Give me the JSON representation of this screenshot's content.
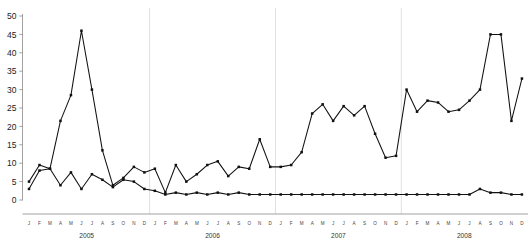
{
  "chart_data": {
    "type": "line",
    "title": "",
    "subtitle": "",
    "xlabel": "",
    "ylabel": "",
    "ylim": [
      0,
      50
    ],
    "yticks": [
      0,
      5,
      10,
      15,
      20,
      25,
      30,
      35,
      40,
      45,
      50
    ],
    "grid": false,
    "legend_position": "none",
    "year_separators": true,
    "marker": "square",
    "line_color": "#111111",
    "marker_color": "#111111",
    "axis_color": "#8a8a8a",
    "separator_color": "#dcdcdc",
    "month_labels": [
      "J",
      "F",
      "M",
      "A",
      "M",
      "J",
      "J",
      "A",
      "S",
      "O",
      "N",
      "D"
    ],
    "years": [
      "2005",
      "2006",
      "2007",
      "2008"
    ],
    "x": [
      "2005-J",
      "2005-F",
      "2005-M",
      "2005-A",
      "2005-M",
      "2005-J",
      "2005-J",
      "2005-A",
      "2005-S",
      "2005-O",
      "2005-N",
      "2005-D",
      "2006-J",
      "2006-F",
      "2006-M",
      "2006-A",
      "2006-M",
      "2006-J",
      "2006-J",
      "2006-A",
      "2006-S",
      "2006-O",
      "2006-N",
      "2006-D",
      "2007-J",
      "2007-F",
      "2007-M",
      "2007-A",
      "2007-M",
      "2007-J",
      "2007-J",
      "2007-A",
      "2007-S",
      "2007-O",
      "2007-N",
      "2007-D",
      "2008-J",
      "2008-F",
      "2008-M",
      "2008-A",
      "2008-M",
      "2008-J",
      "2008-J",
      "2008-A",
      "2008-S",
      "2008-O",
      "2008-N",
      "2008-D"
    ],
    "series": [
      {
        "name": "series-upper",
        "values": [
          5,
          9.5,
          8.5,
          21.5,
          28.5,
          46,
          30,
          13.5,
          4,
          6,
          9,
          7.5,
          8.5,
          2,
          9.5,
          5,
          7,
          9.5,
          10.5,
          6.5,
          9,
          8.5,
          16.5,
          9,
          9,
          9.5,
          13,
          23.5,
          26,
          21.5,
          25.5,
          23,
          25.5,
          18,
          11.5,
          12,
          30,
          24,
          27,
          26.5,
          24,
          24.5,
          27,
          30,
          45,
          45,
          21.5,
          33
        ]
      },
      {
        "name": "series-lower",
        "values": [
          3,
          8,
          8.5,
          4,
          7.5,
          3,
          7,
          5.5,
          3.5,
          5.5,
          5,
          3,
          2.5,
          1.5,
          2,
          1.5,
          2,
          1.5,
          2,
          1.5,
          2,
          1.5,
          1.5,
          1.5,
          1.5,
          1.5,
          1.5,
          1.5,
          1.5,
          1.5,
          1.5,
          1.5,
          1.5,
          1.5,
          1.5,
          1.5,
          1.5,
          1.5,
          1.5,
          1.5,
          1.5,
          1.5,
          1.5,
          3,
          2,
          2,
          1.5,
          1.5
        ]
      }
    ]
  }
}
